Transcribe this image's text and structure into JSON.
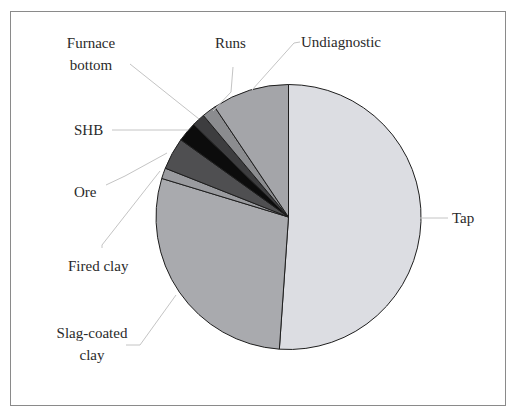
{
  "chart_data": {
    "type": "pie",
    "title": "",
    "start_angle_deg": 0,
    "direction": "clockwise",
    "legend": "none (leader-line labels)",
    "slices": [
      {
        "label": "Tap",
        "value": 51.1,
        "color": "#dcdde2"
      },
      {
        "label": "Slag-coated clay",
        "value": 28.6,
        "color": "#a9aaae"
      },
      {
        "label": "Fired clay",
        "value": 1.3,
        "color": "#9a9b9f"
      },
      {
        "label": "Ore",
        "value": 3.9,
        "color": "#4f4f51"
      },
      {
        "label": "SHB",
        "value": 2.4,
        "color": "#0c0c0c"
      },
      {
        "label": "Furnace bottom",
        "value": 1.6,
        "color": "#3d3d3f"
      },
      {
        "label": "Runs",
        "value": 1.7,
        "color": "#8b8c8f"
      },
      {
        "label": "Undiagnostic",
        "value": 9.4,
        "color": "#a4a5a9"
      }
    ]
  },
  "labels": {
    "tap": "Tap",
    "slag_1": "Slag-coated",
    "slag_2": "clay",
    "fired_clay": "Fired clay",
    "ore": "Ore",
    "shb": "SHB",
    "furnace_1": "Furnace",
    "furnace_2": "bottom",
    "runs": "Runs",
    "undiagnostic": "Undiagnostic"
  }
}
